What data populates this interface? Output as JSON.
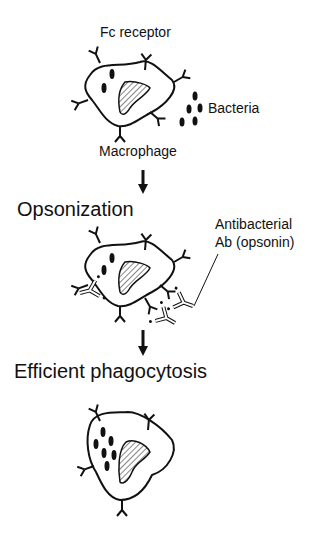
{
  "top_cutoff_text": "",
  "stage1": {
    "receptor_label": "Fc receptor",
    "bacteria_label": "Bacteria",
    "cell_label": "Macrophage"
  },
  "stage2": {
    "title": "Opsonization",
    "antibody_label_line1": "Antibacterial",
    "antibody_label_line2": "Ab (opsonin)"
  },
  "stage3": {
    "title": "Efficient phagocytosis"
  },
  "colors": {
    "ink": "#111111",
    "background": "#ffffff"
  }
}
